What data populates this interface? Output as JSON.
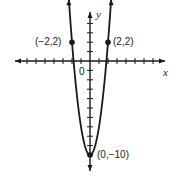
{
  "chart_data": {
    "type": "line",
    "title": "",
    "xlabel": "x",
    "ylabel": "y",
    "origin_label": "0",
    "equation": "y = 3x^2 - 10",
    "series": [
      {
        "name": "parabola",
        "function": "3*x*x - 10",
        "x_range": [
          -2.35,
          2.35
        ],
        "arrows_at_ends": true
      }
    ],
    "points": [
      {
        "x": -2,
        "y": 2,
        "label": "(−2,2)"
      },
      {
        "x": 2,
        "y": 2,
        "label": "(2,2)"
      },
      {
        "x": 0,
        "y": -10,
        "label": "(0,−10)"
      }
    ],
    "xlim": [
      -8,
      8
    ],
    "ylim": [
      -11,
      5
    ],
    "x_ticks_step": 1,
    "y_ticks_step": 1,
    "grid": false,
    "legend": null
  },
  "colors": {
    "ink": "#1a1a1a",
    "background": "#ffffff"
  }
}
